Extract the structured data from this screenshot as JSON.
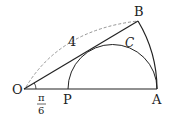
{
  "diagram": {
    "points": {
      "O": {
        "label": "O",
        "x": 24,
        "y": 89
      },
      "A": {
        "label": "A",
        "x": 157,
        "y": 89
      },
      "B": {
        "label": "B",
        "x": 138,
        "y": 21
      },
      "P": {
        "label": "P",
        "x": 68,
        "y": 89
      }
    },
    "curve_label": "C",
    "radius_label": "4",
    "angle_label": {
      "numerator": "π",
      "denominator": "6"
    },
    "colors": {
      "stroke": "#222222",
      "dashed": "#888888"
    }
  }
}
